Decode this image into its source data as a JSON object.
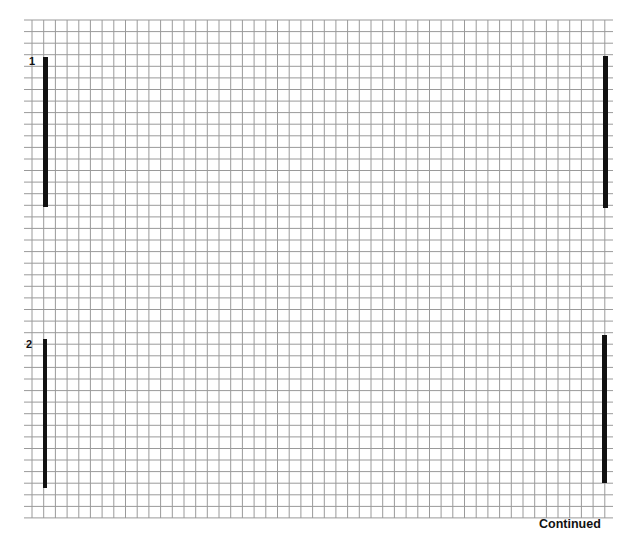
{
  "sheet": {
    "grid": {
      "left": 24,
      "right": 613,
      "top": 20,
      "bottom": 518,
      "first_vertical_x": 32,
      "column_spacing": 11.69,
      "column_count": 49,
      "row_spacing": 11.58,
      "row_count": 43,
      "line_color": "#9a9a9a"
    },
    "sections": [
      {
        "label": "1",
        "label_pos": {
          "x": 29,
          "y": 56
        },
        "left_bar": {
          "x": 43,
          "y": 57,
          "w": 5,
          "h": 150
        },
        "right_bar": {
          "x": 603,
          "y": 56,
          "w": 5,
          "h": 152
        }
      },
      {
        "label": "2",
        "label_pos": {
          "x": 26,
          "y": 339
        },
        "left_bar": {
          "x": 43,
          "y": 339,
          "w": 4,
          "h": 149
        },
        "right_bar": {
          "x": 602,
          "y": 335,
          "w": 5,
          "h": 148
        }
      }
    ],
    "footer": {
      "continued_label": "Continued"
    }
  }
}
